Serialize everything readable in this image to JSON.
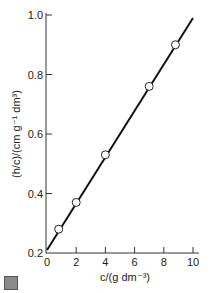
{
  "chart_data": {
    "type": "scatter",
    "title": "",
    "xlabel": "c/(g dm^-3)",
    "ylabel": "(h/c)/(cm g^-1 dm^3)",
    "xlim": [
      0,
      10
    ],
    "ylim": [
      0.2,
      1.0
    ],
    "x_ticks": [
      "0",
      "2",
      "4",
      "6",
      "8",
      "10"
    ],
    "y_ticks": [
      "0.2",
      "0.4",
      "0.6",
      "0.8",
      "1.0"
    ],
    "grid": false,
    "legend": null,
    "points": [
      {
        "x": 0.8,
        "y": 0.28
      },
      {
        "x": 2.0,
        "y": 0.37
      },
      {
        "x": 4.0,
        "y": 0.53
      },
      {
        "x": 7.0,
        "y": 0.76
      },
      {
        "x": 8.8,
        "y": 0.9
      }
    ],
    "fit_line": {
      "x0": 0,
      "y0": 0.21,
      "x1": 10,
      "y1": 0.99
    }
  },
  "labels": {
    "x_axis": "c/(g dm⁻³)",
    "y_axis": "(h/c)/(cm g⁻¹ dm³)"
  }
}
